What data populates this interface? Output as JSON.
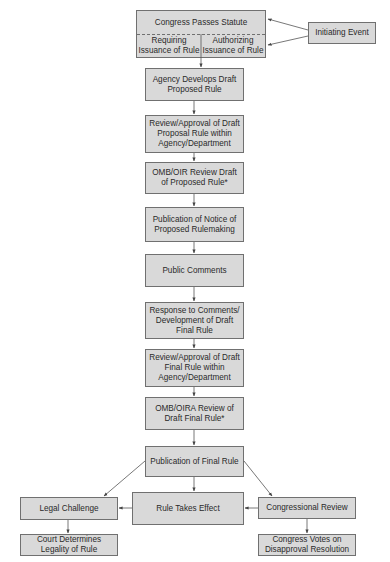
{
  "diagram": {
    "title_box": {
      "label": "Congress Passes Statute",
      "left_option": "Requiring Issuance of Rule",
      "right_option": "Authorizing Issuance of Rule"
    },
    "initiating_event": "Initiating Event",
    "steps": [
      "Agency Develops Draft Proposed Rule",
      "Review/Approval of Draft Proposal Rule within Agency/Department",
      "OMB/OIR Review Draft of Proposed Rule*",
      "Publication of Notice of Proposed Rulemaking",
      "Public Comments",
      "Response to Comments/ Development of Draft Final Rule",
      "Review/Approval of Draft Final Rule within Agency/Department",
      "OMB/OIRA Review of Draft Final Rule*",
      "Publication of Final Rule",
      "Rule Takes Effect"
    ],
    "branches": {
      "legal_challenge": "Legal Challenge",
      "court_determines": "Court Determines Legality of Rule",
      "congressional_review": "Congressional Review",
      "congress_votes": "Congress Votes on Disapproval Resolution"
    },
    "colors": {
      "box_fill": "#d9d9d9",
      "box_border": "#707070",
      "arrow": "#444444",
      "text": "#2a2a2a"
    }
  }
}
